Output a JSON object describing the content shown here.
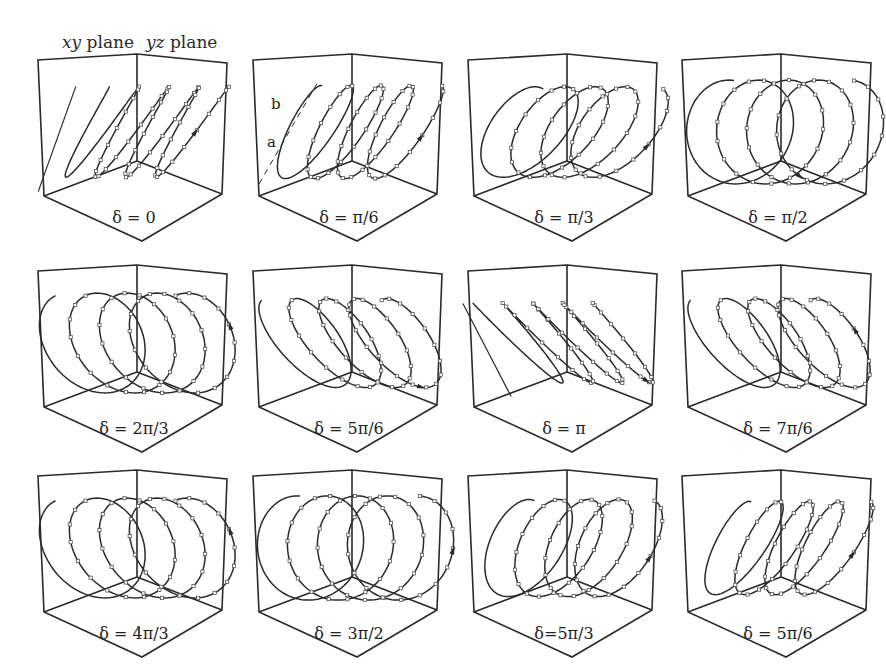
{
  "chart_data": {
    "type": "diagram",
    "title": "",
    "header_labels": {
      "xy_plane": "xy plane",
      "yz_plane": "yz plane",
      "xy_italic": "xy",
      "yz_italic": "yz",
      "plane_word": "plane"
    },
    "annotations": {
      "major_axis": "b",
      "minor_axis": "a"
    },
    "layout": {
      "rows": 3,
      "cols": 4
    },
    "panels": [
      {
        "label": "δ = 0",
        "row": 0,
        "col": 0,
        "shape": "line",
        "tilt": 60,
        "ecc": 0.04,
        "arrow": "up"
      },
      {
        "label": "δ = π/6",
        "row": 0,
        "col": 1,
        "shape": "ellipse",
        "tilt": 62,
        "ecc": 0.25,
        "arrow": "up"
      },
      {
        "label": "δ = π/3",
        "row": 0,
        "col": 2,
        "shape": "ellipse",
        "tilt": 55,
        "ecc": 0.5,
        "arrow": "up"
      },
      {
        "label": "δ = π/2",
        "row": 0,
        "col": 3,
        "shape": "ellipse",
        "tilt": 80,
        "ecc": 0.78,
        "arrow": "down"
      },
      {
        "label": "δ = 2π/3",
        "row": 1,
        "col": 0,
        "shape": "ellipse",
        "tilt": 115,
        "ecc": 0.72,
        "arrow": "up"
      },
      {
        "label": "δ = 5π/6",
        "row": 1,
        "col": 1,
        "shape": "ellipse",
        "tilt": 125,
        "ecc": 0.4,
        "arrow": "down"
      },
      {
        "label": "δ = π",
        "row": 1,
        "col": 2,
        "shape": "line",
        "tilt": 130,
        "ecc": 0.06,
        "arrow": "down"
      },
      {
        "label": "δ = 7π/6",
        "row": 1,
        "col": 3,
        "shape": "ellipse",
        "tilt": 125,
        "ecc": 0.4,
        "arrow": "up"
      },
      {
        "label": "δ = 4π/3",
        "row": 2,
        "col": 0,
        "shape": "ellipse",
        "tilt": 115,
        "ecc": 0.72,
        "arrow": "up"
      },
      {
        "label": "δ = 3π/2",
        "row": 2,
        "col": 1,
        "shape": "ellipse",
        "tilt": 85,
        "ecc": 0.78,
        "arrow": "up"
      },
      {
        "label": "δ=5π/3",
        "row": 2,
        "col": 2,
        "shape": "ellipse",
        "tilt": 65,
        "ecc": 0.5,
        "arrow": "up"
      },
      {
        "label": "δ = 5π/6",
        "row": 2,
        "col": 3,
        "shape": "ellipse",
        "tilt": 62,
        "ecc": 0.3,
        "arrow": "up"
      }
    ],
    "colors": {
      "stroke": "#2a2a2a",
      "background": "#ffffff",
      "marker": "#555555"
    }
  }
}
